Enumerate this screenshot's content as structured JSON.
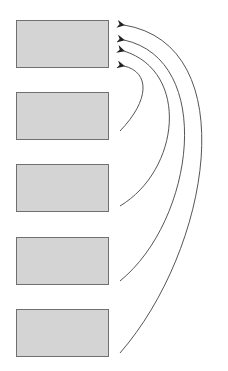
{
  "diagram": {
    "boxes": [
      {
        "id": "box-1",
        "top": 20
      },
      {
        "id": "box-2",
        "top": 92
      },
      {
        "id": "box-3",
        "top": 164
      },
      {
        "id": "box-4",
        "top": 237
      },
      {
        "id": "box-5",
        "top": 309
      }
    ],
    "arrows": [
      {
        "from": "box-2",
        "to": "box-1"
      },
      {
        "from": "box-3",
        "to": "box-1"
      },
      {
        "from": "box-4",
        "to": "box-1"
      },
      {
        "from": "box-5",
        "to": "box-1"
      }
    ],
    "colors": {
      "box_fill": "#d4d4d4",
      "box_border": "#707070",
      "line": "#555555"
    }
  }
}
